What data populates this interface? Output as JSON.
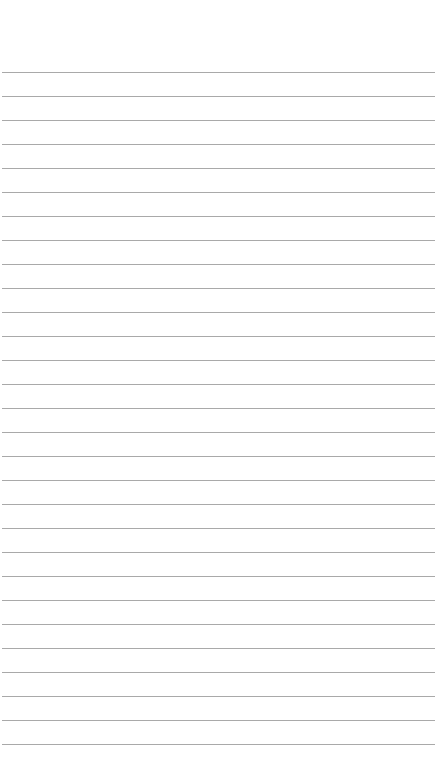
{
  "page": {
    "type": "lined-paper",
    "background_color": "#ffffff",
    "rule_color": "#9a9a9a",
    "rule_count": 29,
    "first_rule_y": 72,
    "rule_spacing": 24,
    "text": ""
  }
}
